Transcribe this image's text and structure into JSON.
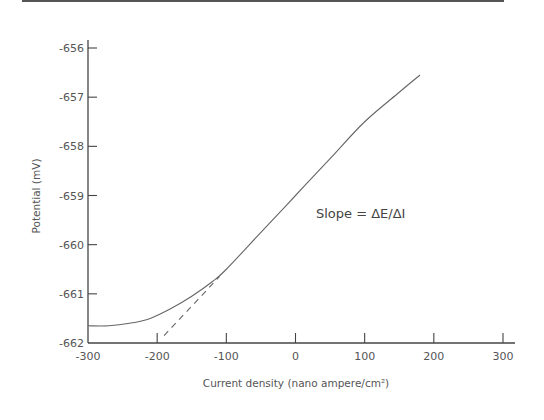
{
  "chart_data": {
    "type": "line",
    "title": "",
    "xlabel": "Current density (nano ampere/cm²)",
    "ylabel": "Potential (mV)",
    "xlim": [
      -300,
      300
    ],
    "ylim": [
      -662,
      -656
    ],
    "xticks": [
      -300,
      -200,
      -100,
      0,
      100,
      200,
      300
    ],
    "yticks": [
      -656,
      -657,
      -658,
      -659,
      -660,
      -661,
      -662
    ],
    "grid": false,
    "legend": null,
    "annotations": [
      {
        "text": "Slope = ΔE/ΔI",
        "x": 20,
        "y": -659.75
      }
    ],
    "series": [
      {
        "name": "polarization curve",
        "style": "solid",
        "x": [
          -300,
          -270,
          -240,
          -210,
          -180,
          -150,
          -120,
          -100,
          -50,
          0,
          50,
          100,
          150,
          180
        ],
        "y": [
          -661.65,
          -661.65,
          -661.6,
          -661.5,
          -661.3,
          -661.05,
          -660.75,
          -660.5,
          -659.75,
          -659.0,
          -658.25,
          -657.5,
          -656.9,
          -656.55
        ]
      },
      {
        "name": "linear extrapolation",
        "style": "dashed",
        "x": [
          -190,
          -110
        ],
        "y": [
          -661.85,
          -660.65
        ]
      }
    ]
  },
  "labels": {
    "x_axis_title": "Current density (nano ampere/cm²)",
    "y_axis_title": "Potential (mV)",
    "annotation": "Slope = ΔE/ΔI",
    "x_ticks": [
      "-300",
      "-200",
      "-100",
      "0",
      "100",
      "200",
      "300"
    ],
    "y_ticks": [
      "-656",
      "-657",
      "-658",
      "-659",
      "-660",
      "-661",
      "-662"
    ]
  }
}
